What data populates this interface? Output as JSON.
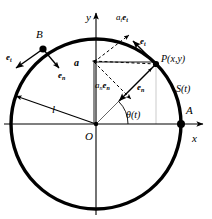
{
  "figure": {
    "colors": {
      "stroke": "#000000",
      "background": "#ffffff",
      "axis": "#1a1a1a"
    }
  },
  "axes": {
    "x_label": "x",
    "y_label": "y",
    "origin_label": "O"
  },
  "points": {
    "P": "P(x,y)",
    "A": "A",
    "B": "B",
    "O": "O"
  },
  "labels": {
    "radius": "l",
    "arc_length": "S(t)",
    "angle": "θ(t)",
    "accel_resultant": "a",
    "tangential_component_main": "a",
    "tangential_component_sub": "t",
    "tangential_component_vec": "e",
    "tangential_component_vecsub": "t",
    "normal_component_main": "a",
    "normal_component_sub": "n",
    "normal_component_vec": "e",
    "normal_component_vecsub": "n",
    "unit_tangent_P": "e",
    "unit_tangent_P_sub": "t",
    "unit_normal_P": "e",
    "unit_normal_P_sub": "n",
    "unit_tangent_B": "e",
    "unit_tangent_B_sub": "t",
    "unit_normal_B": "e",
    "unit_normal_B_sub": "n"
  },
  "geometry": {
    "center_x": 96,
    "center_y": 124,
    "radius": 85,
    "P_x": 156,
    "P_y": 64,
    "B_x": 43,
    "B_y": 49,
    "A_x": 181,
    "A_y": 124,
    "theta_degrees": 45
  }
}
